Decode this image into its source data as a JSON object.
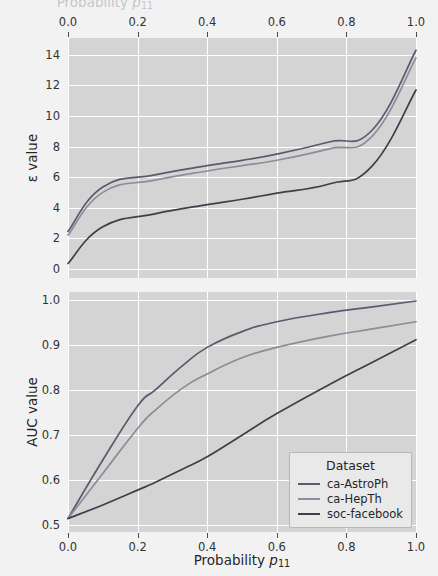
{
  "figure": {
    "width": 438,
    "height": 576,
    "background_color": "#f2f2f2",
    "plot_background_color": "#d4d4d4",
    "gridline_color": "#ffffff",
    "cropped_top_label": "Probability p11"
  },
  "legend": {
    "title": "Dataset",
    "position": "lower-right of bottom panel",
    "entries": [
      {
        "label": "ca-AstroPh",
        "color": "#5a5a6e"
      },
      {
        "label": "ca-HepTh",
        "color": "#8c8c9a"
      },
      {
        "label": "soc-facebook",
        "color": "#3f3f4c"
      }
    ]
  },
  "axis_labels": {
    "x_bottom": "Probability p11",
    "x_bottom_base": "Probability ",
    "x_bottom_var": "p",
    "x_bottom_sub": "11",
    "y_top_panel": "ε value",
    "y_bottom_panel": "AUC value"
  },
  "ticks": {
    "x": [
      "0.0",
      "0.2",
      "0.4",
      "0.6",
      "0.8",
      "1.0"
    ],
    "x_values": [
      0.0,
      0.2,
      0.4,
      0.6,
      0.8,
      1.0
    ],
    "y_top": [
      "0",
      "2",
      "4",
      "6",
      "8",
      "10",
      "12",
      "14"
    ],
    "y_top_values": [
      0,
      2,
      4,
      6,
      8,
      10,
      12,
      14
    ],
    "y_bottom": [
      "0.5",
      "0.6",
      "0.7",
      "0.8",
      "0.9",
      "1.0"
    ],
    "y_bottom_values": [
      0.5,
      0.6,
      0.7,
      0.8,
      0.9,
      1.0
    ]
  },
  "chart_data": [
    {
      "type": "line",
      "panel": "top",
      "title": "",
      "xlabel": "Probability p11",
      "ylabel": "ε value",
      "xlim": [
        0.0,
        1.0
      ],
      "ylim": [
        -0.6,
        15.1
      ],
      "grid": true,
      "x_axis_position": "top",
      "legend_position": "none",
      "x": [
        0.0,
        0.1,
        0.25,
        0.4,
        0.5,
        0.6,
        0.75,
        0.875,
        1.0
      ],
      "series": [
        {
          "name": "ca-AstroPh",
          "color": "#5a5a6e",
          "values": [
            2.45,
            5.35,
            6.15,
            6.75,
            7.1,
            7.5,
            8.3,
            9.1,
            14.3
          ]
        },
        {
          "name": "ca-HepTh",
          "color": "#8c8c9a",
          "values": [
            2.2,
            5.0,
            5.8,
            6.4,
            6.75,
            7.1,
            7.85,
            8.7,
            13.8
          ]
        },
        {
          "name": "soc-facebook",
          "color": "#3f3f4c",
          "values": [
            0.35,
            2.75,
            3.6,
            4.2,
            4.55,
            4.95,
            5.55,
            6.75,
            11.7
          ]
        }
      ]
    },
    {
      "type": "line",
      "panel": "bottom",
      "title": "",
      "xlabel": "Probability p11",
      "ylabel": "AUC value",
      "xlim": [
        0.0,
        1.0
      ],
      "ylim": [
        0.485,
        1.018
      ],
      "grid": true,
      "x_axis_position": "bottom",
      "legend_position": "lower right",
      "x": [
        0.0,
        0.1,
        0.2,
        0.25,
        0.33,
        0.4,
        0.5,
        0.6,
        0.75,
        0.875,
        1.0
      ],
      "series": [
        {
          "name": "ca-AstroPh",
          "color": "#5a5a6e",
          "values": [
            0.515,
            0.645,
            0.765,
            0.8,
            0.855,
            0.895,
            0.93,
            0.952,
            0.972,
            0.985,
            0.998
          ]
        },
        {
          "name": "ca-HepTh",
          "color": "#8c8c9a",
          "values": [
            0.515,
            0.615,
            0.715,
            0.755,
            0.805,
            0.836,
            0.872,
            0.895,
            0.92,
            0.936,
            0.952
          ]
        },
        {
          "name": "soc-facebook",
          "color": "#3f3f4c",
          "values": [
            0.515,
            0.545,
            0.578,
            0.595,
            0.625,
            0.652,
            0.7,
            0.748,
            0.812,
            0.862,
            0.912
          ]
        }
      ]
    }
  ]
}
